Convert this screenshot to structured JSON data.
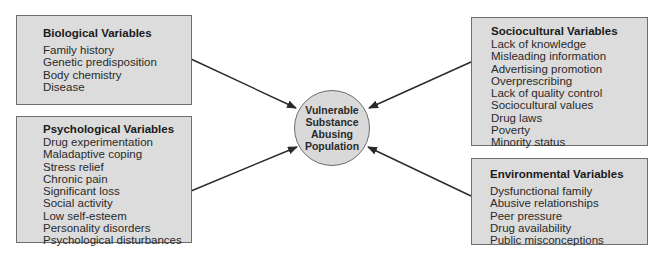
{
  "diagram": {
    "center": {
      "lines": [
        "Vulnerable",
        "Substance",
        "Abusing",
        "Population"
      ]
    },
    "boxes": {
      "biological": {
        "title": "Biological Variables",
        "items": [
          "Family history",
          "Genetic predisposition",
          "Body chemistry",
          "Disease"
        ]
      },
      "psychological": {
        "title": "Psychological Variables",
        "items": [
          "Drug experimentation",
          "Maladaptive coping",
          "Stress relief",
          "Chronic pain",
          "Significant loss",
          "Social activity",
          "Low self-esteem",
          "Personality disorders",
          "Psychological disturbances"
        ]
      },
      "sociocultural": {
        "title": "Sociocultural Variables",
        "items": [
          "Lack of knowledge",
          "Misleading information",
          "Advertising promotion",
          "Overprescribing",
          "Lack of quality control",
          "Sociocultural values",
          "Drug laws",
          "Poverty",
          "Minority status"
        ]
      },
      "environmental": {
        "title": "Environmental Variables",
        "items": [
          "Dysfunctional family",
          "Abusive relationships",
          "Peer pressure",
          "Drug availability",
          "Public misconceptions"
        ]
      }
    },
    "colors": {
      "box_fill": "#dcdcdc",
      "circle_fill": "#d9d9d9",
      "border": "#6e6e6e",
      "arrow": "#2a2a2a"
    }
  }
}
